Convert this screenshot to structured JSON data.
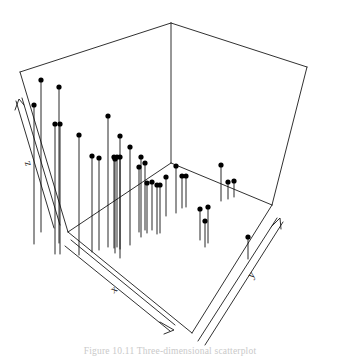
{
  "figure": {
    "title": "",
    "caption": "Figure 10.11  Three-dimensional scatterplot",
    "axis_labels": {
      "x": "x",
      "y": "y",
      "z": "z"
    },
    "stroke_color": "#1a1a1a",
    "point_color": "#000000",
    "background_color": "#ffffff"
  },
  "chart_data": {
    "type": "scatter",
    "subtype": "3d-stem-needle-plot",
    "title": "",
    "xlabel": "x",
    "ylabel": "y",
    "zlabel": "z",
    "grid": false,
    "legend": null,
    "axis_ticks": {
      "x": [],
      "y": [],
      "z": []
    },
    "projection": {
      "note": "Oblique 3D box wireframe; points drawn as filled dots with vertical needles dropping to the floor plane.",
      "box_corners_px": {
        "back_top": [
          171,
          23
        ],
        "left_top": [
          20,
          72
        ],
        "right_top": [
          307,
          67
        ],
        "back_bottom": [
          171,
          163
        ],
        "left_bottom": [
          68,
          232
        ],
        "right_bottom": [
          272,
          205
        ],
        "front_bottom": [
          192,
          333
        ]
      }
    },
    "points_px": [
      {
        "x": 41,
        "y": 80,
        "floor_y": 232
      },
      {
        "x": 59,
        "y": 87,
        "floor_y": 243
      },
      {
        "x": 34,
        "y": 105,
        "floor_y": 244
      },
      {
        "x": 55,
        "y": 124,
        "floor_y": 254
      },
      {
        "x": 60,
        "y": 124,
        "floor_y": 254
      },
      {
        "x": 79,
        "y": 135,
        "floor_y": 255
      },
      {
        "x": 108,
        "y": 116,
        "floor_y": 247
      },
      {
        "x": 92,
        "y": 156,
        "floor_y": 252
      },
      {
        "x": 99,
        "y": 158,
        "floor_y": 250
      },
      {
        "x": 120,
        "y": 136,
        "floor_y": 258
      },
      {
        "x": 114,
        "y": 157,
        "floor_y": 248
      },
      {
        "x": 117,
        "y": 157,
        "floor_y": 247
      },
      {
        "x": 120,
        "y": 157,
        "floor_y": 249
      },
      {
        "x": 130,
        "y": 147,
        "floor_y": 245
      },
      {
        "x": 115,
        "y": 159,
        "floor_y": 253
      },
      {
        "x": 141,
        "y": 157,
        "floor_y": 237
      },
      {
        "x": 139,
        "y": 167,
        "floor_y": 232
      },
      {
        "x": 145,
        "y": 163,
        "floor_y": 230
      },
      {
        "x": 147,
        "y": 183,
        "floor_y": 233
      },
      {
        "x": 152,
        "y": 182,
        "floor_y": 230
      },
      {
        "x": 157,
        "y": 185,
        "floor_y": 234
      },
      {
        "x": 160,
        "y": 185,
        "floor_y": 233
      },
      {
        "x": 166,
        "y": 177,
        "floor_y": 216
      },
      {
        "x": 176,
        "y": 166,
        "floor_y": 213
      },
      {
        "x": 182,
        "y": 176,
        "floor_y": 208
      },
      {
        "x": 186,
        "y": 176,
        "floor_y": 207
      },
      {
        "x": 221,
        "y": 165,
        "floor_y": 201
      },
      {
        "x": 228,
        "y": 182,
        "floor_y": 199
      },
      {
        "x": 234,
        "y": 181,
        "floor_y": 197
      },
      {
        "x": 200,
        "y": 209,
        "floor_y": 240
      },
      {
        "x": 208,
        "y": 207,
        "floor_y": 243
      },
      {
        "x": 205,
        "y": 221,
        "floor_y": 247
      },
      {
        "x": 248,
        "y": 237,
        "floor_y": 259
      }
    ],
    "point_count": 33
  }
}
